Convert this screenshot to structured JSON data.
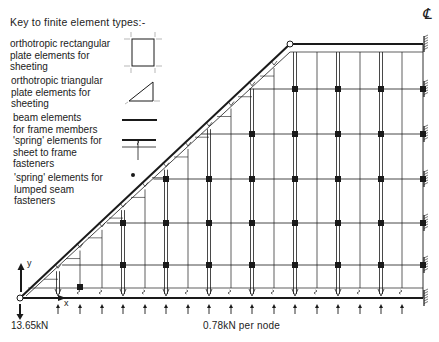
{
  "key": {
    "title": "Key to finite element types:-",
    "items": [
      {
        "label_lines": [
          "orthotropic rectangular",
          "plate elements for",
          "sheeting"
        ],
        "symbol": "rectangle-plate-icon"
      },
      {
        "label_lines": [
          "orthotropic triangular",
          "plate elements  for",
          "sheeting"
        ],
        "symbol": "triangle-plate-icon"
      },
      {
        "label_lines": [
          "beam elements",
          "for frame members"
        ],
        "symbol": "beam-line-icon"
      },
      {
        "label_lines": [
          "'spring' elements for",
          "sheet to frame",
          "fasteners"
        ],
        "symbol": "spring-fastener-icon"
      },
      {
        "label_lines": [
          "'spring' elements for",
          "lumped seam",
          "fasteners"
        ],
        "symbol": "dot-icon"
      }
    ]
  },
  "labels": {
    "reaction": "13.65kN",
    "nodal_load": "0.78kN per node",
    "axis_x": "x",
    "axis_y": "y",
    "centerline": "℄"
  },
  "geometry": {
    "origin": [
      20,
      298
    ],
    "apex": [
      290,
      44
    ],
    "right_edge_x": 423,
    "rows_y": [
      44,
      89,
      134,
      179,
      223,
      265,
      298
    ],
    "columns_x": [
      58,
      80,
      102,
      123,
      145,
      166,
      188,
      209,
      231,
      252,
      274,
      295,
      317,
      338,
      360,
      381,
      402
    ],
    "seam_columns_x": [
      123,
      166,
      209,
      252,
      295,
      338,
      381
    ],
    "support_rows_y": [
      44,
      89,
      134,
      179,
      223,
      265,
      298
    ]
  },
  "colors": {
    "line": "#1a1a1a",
    "background": "#ffffff"
  }
}
